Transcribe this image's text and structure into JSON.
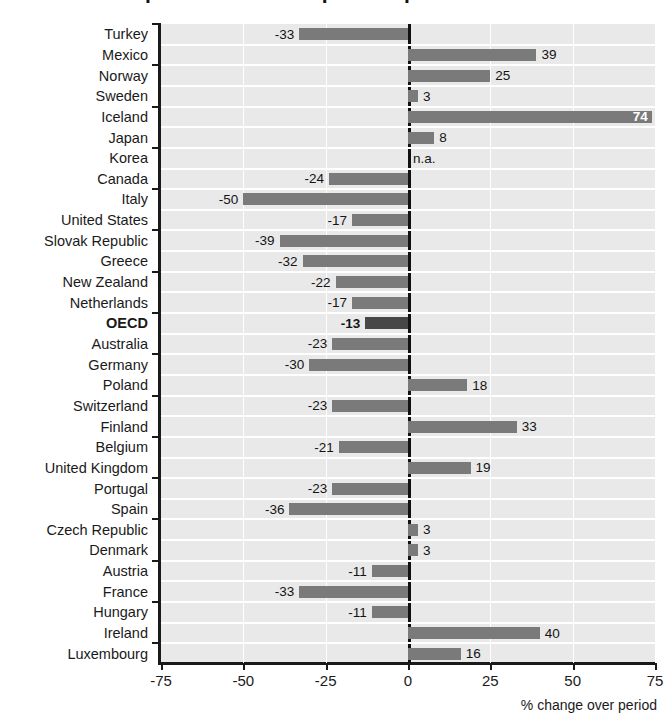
{
  "title_clipped": "Recent development in consumption expenditure",
  "chart_data": {
    "type": "bar",
    "orientation": "horizontal",
    "title": "",
    "xlabel": "% change over period",
    "ylabel": "",
    "xlim": [
      -75,
      75
    ],
    "xticks": [
      -75,
      -50,
      -25,
      0,
      25,
      50,
      75
    ],
    "xtick_labels": [
      "-75",
      "-50",
      "-25",
      "0",
      "25",
      "50",
      "75"
    ],
    "grid": true,
    "legend": "none",
    "highlight_category": "OECD",
    "na_label": "n.a.",
    "categories": [
      "Turkey",
      "Mexico",
      "Norway",
      "Sweden",
      "Iceland",
      "Japan",
      "Korea",
      "Canada",
      "Italy",
      "United States",
      "Slovak Republic",
      "Greece",
      "New Zealand",
      "Netherlands",
      "OECD",
      "Australia",
      "Germany",
      "Poland",
      "Switzerland",
      "Finland",
      "Belgium",
      "United Kingdom",
      "Portugal",
      "Spain",
      "Czech Republic",
      "Denmark",
      "Austria",
      "France",
      "Hungary",
      "Ireland",
      "Luxembourg"
    ],
    "values": [
      -33,
      39,
      25,
      3,
      74,
      8,
      null,
      -24,
      -50,
      -17,
      -39,
      -32,
      -22,
      -17,
      -13,
      -23,
      -30,
      18,
      -23,
      33,
      -21,
      19,
      -23,
      -36,
      3,
      3,
      -11,
      -33,
      -11,
      40,
      16
    ],
    "value_labels": [
      "-33",
      "39",
      "25",
      "3",
      "74",
      "8",
      "n.a.",
      "-24",
      "-50",
      "-17",
      "-39",
      "-32",
      "-22",
      "-17",
      "-13",
      "-23",
      "-30",
      "18",
      "-23",
      "33",
      "-21",
      "19",
      "-23",
      "-36",
      "3",
      "3",
      "-11",
      "-33",
      "-11",
      "40",
      "16"
    ]
  },
  "colors": {
    "bar": "#7a7a7a",
    "bar_highlight": "#474747",
    "plot_background": "#e9e9e9",
    "gridline": "#ffffff",
    "axis": "#1a1a1a",
    "text": "#141414"
  }
}
